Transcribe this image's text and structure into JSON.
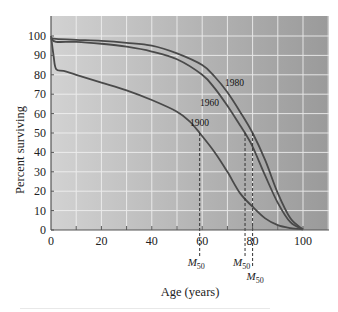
{
  "chart_data": {
    "type": "line",
    "title": "",
    "xlabel": "Age (years)",
    "ylabel": "Percent surviving",
    "xlim": [
      0,
      110
    ],
    "ylim": [
      0,
      110
    ],
    "x_ticks": [
      0,
      20,
      40,
      60,
      80,
      100
    ],
    "y_ticks": [
      0,
      10,
      20,
      30,
      40,
      50,
      60,
      70,
      80,
      90,
      100
    ],
    "grid": true,
    "legend": "inline labels",
    "series": [
      {
        "name": "1900",
        "x": [
          0,
          1,
          2,
          5,
          10,
          20,
          30,
          40,
          50,
          55,
          59,
          65,
          70,
          75,
          80,
          85,
          90,
          95,
          100
        ],
        "values": [
          100,
          90,
          83,
          82,
          80,
          76,
          72,
          67,
          61,
          56,
          50,
          40,
          30,
          19,
          12,
          6,
          2.5,
          1,
          0.3
        ]
      },
      {
        "name": "1960",
        "x": [
          0,
          2,
          10,
          20,
          30,
          40,
          50,
          60,
          65,
          70,
          75,
          77,
          80,
          85,
          90,
          95,
          100
        ],
        "values": [
          99,
          97,
          97,
          96,
          94.5,
          92,
          88,
          80,
          73,
          64,
          54,
          50,
          43,
          28,
          14,
          4,
          0.3
        ]
      },
      {
        "name": "1980",
        "x": [
          0,
          2,
          10,
          20,
          30,
          40,
          50,
          60,
          65,
          70,
          75,
          80,
          85,
          90,
          95,
          100
        ],
        "values": [
          99,
          98.5,
          98,
          97.5,
          96.5,
          95,
          91,
          85,
          79,
          71,
          61,
          50,
          36,
          19,
          6,
          0.3
        ]
      }
    ],
    "annotations": [
      {
        "text": "M50",
        "x": 59,
        "series": "1900"
      },
      {
        "text": "M50",
        "x": 77,
        "series": "1960"
      },
      {
        "text": "M50",
        "x": 80,
        "series": "1980"
      }
    ]
  },
  "labels": {
    "y_axis": "Percent surviving",
    "x_axis": "Age (years)",
    "series_1980": "1980",
    "series_1960": "1960",
    "series_1900": "1900",
    "m": "M",
    "m_sub": "50"
  }
}
